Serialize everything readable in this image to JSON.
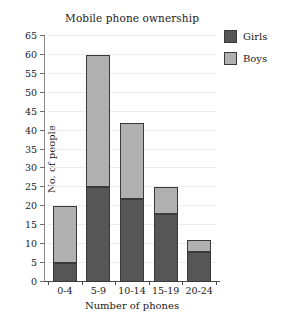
{
  "chart_data": {
    "type": "bar",
    "subtype": "stacked-bar",
    "title": "Mobile phone ownership",
    "xlabel": "Number of phones",
    "ylabel": "No. of people",
    "categories": [
      "0-4",
      "5-9",
      "10-14",
      "15-19",
      "20-24"
    ],
    "series": [
      {
        "name": "Girls",
        "color": "#565656",
        "values": [
          5,
          25,
          22,
          18,
          8
        ]
      },
      {
        "name": "Boys",
        "color": "#b0b0b0",
        "values": [
          15,
          35,
          20,
          7,
          3
        ]
      }
    ],
    "totals": [
      20,
      60,
      42,
      25,
      11
    ],
    "ylim": [
      0,
      65
    ],
    "ytick_step": 5,
    "yticks": [
      0,
      5,
      10,
      15,
      20,
      25,
      30,
      35,
      40,
      45,
      50,
      55,
      60,
      65
    ],
    "ytick_labels": [
      "0",
      "5",
      "10",
      "15",
      "20",
      "25",
      "30",
      "35",
      "40",
      "45",
      "50",
      "55",
      "60",
      "65"
    ],
    "grid": true,
    "grid_axis": "y",
    "grid_color": "#ededed",
    "legend": {
      "position": "right-top",
      "entries": [
        "Girls",
        "Boys"
      ]
    },
    "bar_border_color": "#3a3a3a",
    "background": "#ffffff"
  }
}
